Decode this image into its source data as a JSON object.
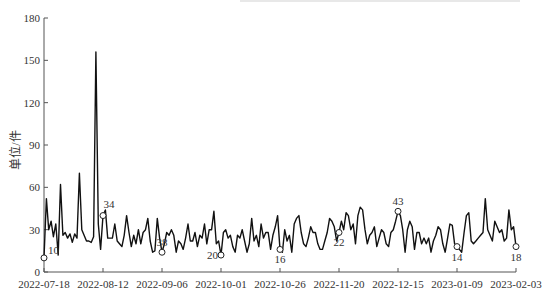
{
  "chart_data": {
    "type": "line",
    "title": "",
    "xlabel": "",
    "ylabel": "单位/件",
    "ylim": [
      0,
      180
    ],
    "yticks": [
      0,
      30,
      60,
      90,
      120,
      150,
      180
    ],
    "xticks": [
      "2022-07-18",
      "2022-08-12",
      "2022-09-06",
      "2022-10-01",
      "2022-10-26",
      "2022-11-20",
      "2022-12-15",
      "2023-01-09",
      "2023-02-03"
    ],
    "grid": false,
    "legend": null,
    "x_start": "2022-07-18",
    "x_end": "2023-02-03",
    "series": [
      {
        "name": "单位/件",
        "color": "#111111",
        "values": [
          10,
          52,
          30,
          36,
          25,
          34,
          12,
          62,
          26,
          28,
          24,
          27,
          21,
          27,
          24,
          70,
          30,
          26,
          22,
          22,
          21,
          25,
          156,
          34,
          16,
          40,
          44,
          24,
          24,
          24,
          34,
          22,
          20,
          18,
          26,
          40,
          28,
          18,
          26,
          20,
          30,
          20,
          28,
          30,
          38,
          22,
          14,
          15,
          38,
          24,
          14,
          20,
          28,
          26,
          30,
          26,
          14,
          22,
          20,
          16,
          24,
          34,
          22,
          22,
          28,
          18,
          26,
          24,
          34,
          20,
          30,
          30,
          43,
          20,
          22,
          12,
          28,
          30,
          24,
          26,
          18,
          14,
          26,
          24,
          30,
          22,
          14,
          20,
          38,
          22,
          26,
          18,
          34,
          24,
          28,
          28,
          16,
          26,
          32,
          40,
          16,
          14,
          30,
          22,
          26,
          14,
          34,
          38,
          40,
          28,
          20,
          18,
          24,
          32,
          28,
          28,
          20,
          16,
          16,
          22,
          28,
          38,
          36,
          32,
          22,
          28,
          36,
          30,
          42,
          40,
          30,
          34,
          20,
          40,
          46,
          44,
          30,
          20,
          26,
          28,
          32,
          18,
          24,
          30,
          28,
          20,
          18,
          28,
          30,
          36,
          43,
          40,
          30,
          14,
          30,
          36,
          32,
          16,
          28,
          28,
          20,
          24,
          20,
          24,
          14,
          22,
          26,
          32,
          30,
          20,
          14,
          24,
          34,
          33,
          20,
          18,
          16,
          14,
          28,
          40,
          42,
          22,
          20,
          22,
          24,
          26,
          28,
          52,
          30,
          26,
          22,
          36,
          32,
          28,
          30,
          22,
          24,
          44,
          30,
          32,
          18
        ],
        "annotations": [
          {
            "label": "10",
            "index": 0
          },
          {
            "label": "34",
            "index": 25
          },
          {
            "label": "38",
            "index": 50
          },
          {
            "label": "20",
            "index": 75
          },
          {
            "label": "16",
            "index": 100
          },
          {
            "label": "22",
            "index": 125
          },
          {
            "label": "43",
            "index": 150
          },
          {
            "label": "14",
            "index": 175
          },
          {
            "label": "18",
            "index": 200
          }
        ]
      }
    ]
  }
}
